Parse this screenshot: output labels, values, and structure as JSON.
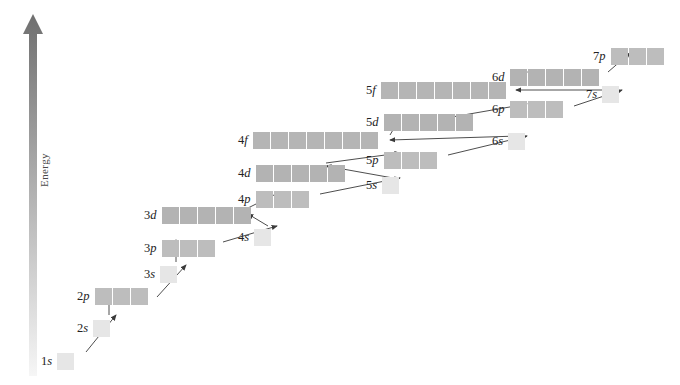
{
  "figure": {
    "background_color": "#ffffff",
    "axis": {
      "name": "energy-axis",
      "label": "Energy",
      "direction": "up",
      "arrow_gradient_top_color": "#6f6f6f",
      "arrow_gradient_bottom_color": "#f2f2f2"
    },
    "colors": {
      "s_box": "#e6e6e6",
      "p_box": "#bdbdbd",
      "d_box": "#b3b3b3",
      "f_box": "#b5b5b5",
      "arrow_stroke": "#3a3a3a",
      "label_text": "#222222"
    }
  },
  "chart_data": {
    "type": "diagram",
    "xlabel": "",
    "ylabel": "Energy",
    "legend": [],
    "orbitals": [
      {
        "id": "1s",
        "n": 1,
        "sub": "s",
        "boxes": 1,
        "x": 65,
        "y": 352,
        "label": "1s",
        "label_side": "left"
      },
      {
        "id": "2s",
        "n": 2,
        "sub": "s",
        "boxes": 1,
        "x": 101,
        "y": 319,
        "label": "2s",
        "label_side": "left"
      },
      {
        "id": "2p",
        "n": 2,
        "sub": "p",
        "boxes": 3,
        "x": 101,
        "y": 287,
        "label": "2p",
        "label_side": "left"
      },
      {
        "id": "3s",
        "n": 3,
        "sub": "s",
        "boxes": 1,
        "x": 168,
        "y": 265,
        "label": "3s",
        "label_side": "left"
      },
      {
        "id": "3p",
        "n": 3,
        "sub": "p",
        "boxes": 3,
        "x": 168,
        "y": 239,
        "label": "3p",
        "label_side": "left"
      },
      {
        "id": "3d",
        "n": 3,
        "sub": "d",
        "boxes": 5,
        "x": 168,
        "y": 206,
        "label": "3d",
        "label_side": "left"
      },
      {
        "id": "4s",
        "n": 4,
        "sub": "s",
        "boxes": 1,
        "x": 262,
        "y": 228,
        "label": "4s",
        "label_side": "left"
      },
      {
        "id": "4p",
        "n": 4,
        "sub": "p",
        "boxes": 3,
        "x": 262,
        "y": 190,
        "label": "4p",
        "label_side": "left"
      },
      {
        "id": "4d",
        "n": 4,
        "sub": "d",
        "boxes": 5,
        "x": 262,
        "y": 164,
        "label": "4d",
        "label_side": "left"
      },
      {
        "id": "4f",
        "n": 4,
        "sub": "f",
        "boxes": 7,
        "x": 262,
        "y": 131,
        "label": "4f",
        "label_side": "left"
      },
      {
        "id": "5s",
        "n": 5,
        "sub": "s",
        "boxes": 1,
        "x": 390,
        "y": 176,
        "label": "5s",
        "label_side": "left"
      },
      {
        "id": "5p",
        "n": 5,
        "sub": "p",
        "boxes": 3,
        "x": 390,
        "y": 151,
        "label": "5p",
        "label_side": "left"
      },
      {
        "id": "5d",
        "n": 5,
        "sub": "d",
        "boxes": 5,
        "x": 390,
        "y": 113,
        "label": "5d",
        "label_side": "left"
      },
      {
        "id": "5f",
        "n": 5,
        "sub": "f",
        "boxes": 7,
        "x": 390,
        "y": 81,
        "label": "5f",
        "label_side": "left"
      },
      {
        "id": "6s",
        "n": 6,
        "sub": "s",
        "boxes": 1,
        "x": 516,
        "y": 132,
        "label": "6s",
        "label_side": "left"
      },
      {
        "id": "6p",
        "n": 6,
        "sub": "p",
        "boxes": 3,
        "x": 516,
        "y": 100,
        "label": "6p",
        "label_side": "left"
      },
      {
        "id": "6d",
        "n": 6,
        "sub": "d",
        "boxes": 5,
        "x": 516,
        "y": 68,
        "label": "6d",
        "label_side": "left"
      },
      {
        "id": "7s",
        "n": 7,
        "sub": "s",
        "boxes": 1,
        "x": 610,
        "y": 85,
        "label": "7s",
        "label_side": "left"
      },
      {
        "id": "7p",
        "n": 7,
        "sub": "p",
        "boxes": 3,
        "x": 617,
        "y": 47,
        "label": "7p",
        "label_side": "left"
      }
    ],
    "filling_arrows": [
      {
        "from": "1s",
        "to": "2s",
        "kind": "diagonal",
        "x1": 86,
        "y1": 352,
        "x2": 116,
        "y2": 315
      },
      {
        "from": "2s",
        "to": "2p",
        "kind": "vertical",
        "x1": 109,
        "y1": 315,
        "x2": 109,
        "y2": 289
      },
      {
        "from": "2p",
        "to": "3s",
        "kind": "diagonal",
        "x1": 157,
        "y1": 297,
        "x2": 186,
        "y2": 265
      },
      {
        "from": "3s",
        "to": "3p",
        "kind": "vertical",
        "x1": 176,
        "y1": 262,
        "x2": 176,
        "y2": 240
      },
      {
        "from": "3p",
        "to": "4s",
        "kind": "diagonal",
        "x1": 223,
        "y1": 242,
        "x2": 277,
        "y2": 226
      },
      {
        "from": "4s",
        "to": "3d",
        "kind": "diagonal",
        "x1": 268,
        "y1": 226,
        "x2": 248,
        "y2": 214
      },
      {
        "from": "3d",
        "to": "4p",
        "kind": "diagonal",
        "x1": 248,
        "y1": 208,
        "x2": 280,
        "y2": 192
      },
      {
        "from": "4p",
        "to": "5s",
        "kind": "diagonal",
        "x1": 320,
        "y1": 194,
        "x2": 400,
        "y2": 178
      },
      {
        "from": "5s",
        "to": "4d",
        "kind": "diagonal",
        "x1": 393,
        "y1": 178,
        "x2": 326,
        "y2": 166
      },
      {
        "from": "4d",
        "to": "5p",
        "kind": "diagonal",
        "x1": 326,
        "y1": 163,
        "x2": 400,
        "y2": 153
      },
      {
        "from": "5p",
        "to": "6s",
        "kind": "diagonal",
        "x1": 448,
        "y1": 155,
        "x2": 527,
        "y2": 136
      },
      {
        "from": "6s",
        "to": "4f",
        "kind": "diagonal",
        "x1": 519,
        "y1": 136,
        "x2": 390,
        "y2": 140
      },
      {
        "from": "4f",
        "to": "5d",
        "kind": "diagonal",
        "x1": 390,
        "y1": 135,
        "x2": 400,
        "y2": 118
      },
      {
        "from": "5d",
        "to": "6p",
        "kind": "diagonal",
        "x1": 452,
        "y1": 117,
        "x2": 527,
        "y2": 104
      },
      {
        "from": "6p",
        "to": "7s",
        "kind": "diagonal",
        "x1": 574,
        "y1": 106,
        "x2": 622,
        "y2": 90
      },
      {
        "from": "7s",
        "to": "5f",
        "kind": "diagonal",
        "x1": 613,
        "y1": 90,
        "x2": 516,
        "y2": 90
      },
      {
        "from": "5f",
        "to": "6d",
        "kind": "diagonal",
        "x1": 516,
        "y1": 86,
        "x2": 527,
        "y2": 72
      },
      {
        "from": "6d",
        "to": "7p",
        "kind": "diagonal",
        "x1": 608,
        "y1": 72,
        "x2": 630,
        "y2": 53
      }
    ]
  }
}
